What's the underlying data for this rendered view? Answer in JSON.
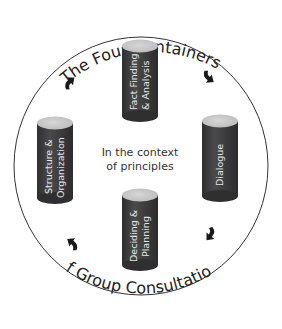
{
  "diagram": {
    "title_top": "The Four Containers",
    "title_bottom": "of Group Consultation",
    "center_text": {
      "line1": "In the context",
      "line2": "of principles"
    },
    "containers": [
      {
        "id": "top",
        "line1": "Fact Finding",
        "line2": "& Analysis"
      },
      {
        "id": "right",
        "line1": "Dialogue",
        "line2": ""
      },
      {
        "id": "bottom",
        "line1": "Deciding &",
        "line2": "Planning"
      },
      {
        "id": "left",
        "line1": "Structure &",
        "line2": "Organization"
      }
    ],
    "flow_direction": "clockwise",
    "colors": {
      "cylinder_body": "#3d3d3f",
      "cylinder_top": "#c9c9c9",
      "cylinder_label": "#e6e6e6",
      "circle_stroke": "#333333",
      "arrow": "#1a1a1a",
      "text": "#222222"
    }
  }
}
